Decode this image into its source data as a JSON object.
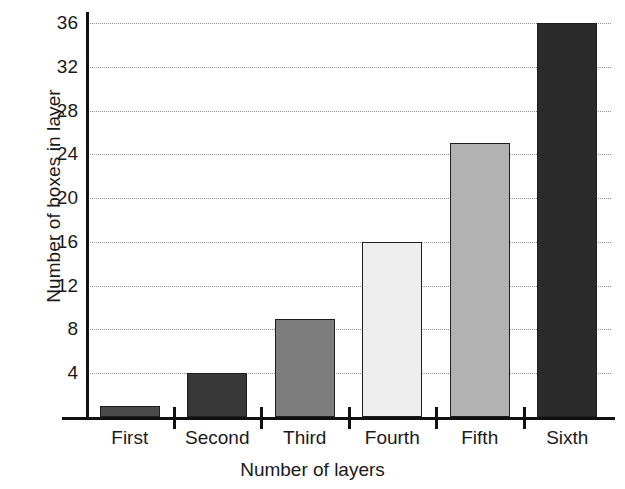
{
  "chart_data": {
    "type": "bar",
    "title": "",
    "xlabel": "Number of layers",
    "ylabel": "Number of boxes in layer",
    "categories": [
      "First",
      "Second",
      "Third",
      "Fourth",
      "Fifth",
      "Sixth"
    ],
    "values": [
      1,
      4,
      9,
      16,
      25,
      36
    ],
    "ylim": [
      0,
      38
    ],
    "yticks": [
      4,
      8,
      12,
      16,
      20,
      24,
      28,
      32,
      36
    ],
    "ytick_labels": [
      "4",
      "8",
      "12",
      "16",
      "20",
      "24",
      "28",
      "32",
      "36"
    ],
    "grid": true,
    "grid_style": "dotted-horizontal",
    "legend": "none",
    "bar_colors": [
      "#4a4a4a",
      "#383838",
      "#7d7d7d",
      "#eeeeee",
      "#b2b2b2",
      "#2b2b2b"
    ],
    "bar_edge_color": "#1f1f1f",
    "axis_color": "#111111",
    "background_color": "#ffffff",
    "text_color": "#1a1a1a"
  },
  "axes": {
    "y_title": "Number of boxes in layer",
    "x_title": "Number of layers"
  }
}
